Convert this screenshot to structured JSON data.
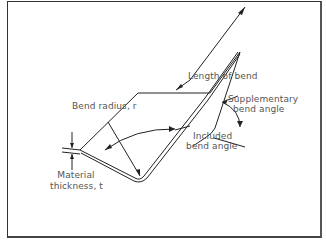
{
  "diagram": {
    "labels": {
      "length_of_bend": "Length of bend",
      "bend_radius": "Bend radius, r",
      "included_bend_angle_1": "Included",
      "included_bend_angle_2": "bend angle",
      "supplementary_bend_angle_1": "Supplementary",
      "supplementary_bend_angle_2": "bend angle",
      "material_thickness_1": "Material",
      "material_thickness_2": "thickness, t"
    },
    "colors": {
      "line": "#222222",
      "text": "#555555",
      "background": "#ffffff"
    }
  }
}
